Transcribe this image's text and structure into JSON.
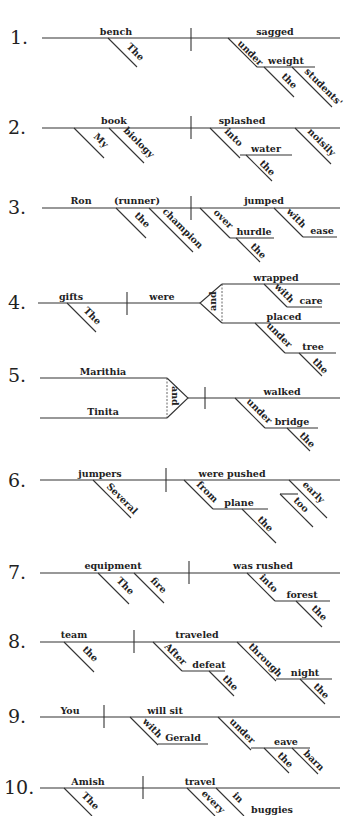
{
  "diagrams": [
    {
      "number": "1.",
      "subject": "bench",
      "predicate": "sagged",
      "modifiers": {
        "the1": "The",
        "under": "under",
        "weight": "weight",
        "the2": "the",
        "students": "students'"
      }
    },
    {
      "number": "2.",
      "subject": "book",
      "predicate": "splashed",
      "modifiers": {
        "my": "My",
        "biology": "biology",
        "into": "into",
        "water": "water",
        "the": "the",
        "noisily": "noisily"
      }
    },
    {
      "number": "3.",
      "subject": "Ron",
      "appositive": "(runner)",
      "predicate": "jumped",
      "modifiers": {
        "the1": "the",
        "champion": "champion",
        "over": "over",
        "hurdle": "hurdle",
        "the2": "the",
        "with": "with",
        "ease": "ease"
      }
    },
    {
      "number": "4.",
      "subject": "gifts",
      "predicate": "were",
      "conjunction": "and",
      "verb1": "wrapped",
      "verb2": "placed",
      "modifiers": {
        "the1": "The",
        "with": "with",
        "care": "care",
        "under": "under",
        "tree": "tree",
        "the2": "the"
      }
    },
    {
      "number": "5.",
      "subject1": "Marithia",
      "subject2": "Tinita",
      "conjunction": "and",
      "predicate": "walked",
      "modifiers": {
        "under": "under",
        "bridge": "bridge",
        "the": "the"
      }
    },
    {
      "number": "6.",
      "subject": "jumpers",
      "predicate": "were pushed",
      "modifiers": {
        "several": "Several",
        "from": "from",
        "plane": "plane",
        "the": "the",
        "early": "early",
        "too": "too"
      }
    },
    {
      "number": "7.",
      "subject": "equipment",
      "predicate": "was rushed",
      "modifiers": {
        "the1": "The",
        "fire": "fire",
        "into": "into",
        "forest": "forest",
        "the2": "the"
      }
    },
    {
      "number": "8.",
      "subject": "team",
      "predicate": "traveled",
      "modifiers": {
        "the1": "the",
        "after": "After",
        "defeat": "defeat",
        "the2": "the",
        "through": "through",
        "night": "night",
        "the3": "the"
      }
    },
    {
      "number": "9.",
      "subject": "You",
      "predicate": "will sit",
      "modifiers": {
        "with": "with",
        "gerald": "Gerald",
        "under": "under",
        "eave": "eave",
        "the": "the",
        "barn": "barn"
      }
    },
    {
      "number": "10.",
      "subject": "Amish",
      "predicate": "travel",
      "modifiers": {
        "the": "The",
        "every": "every",
        "in": "in",
        "buggies": "buggies"
      }
    }
  ]
}
